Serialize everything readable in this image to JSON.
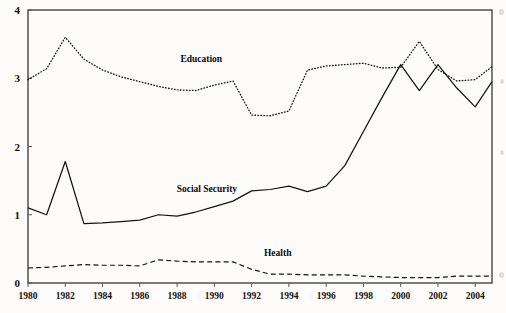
{
  "chart_data": {
    "type": "line",
    "title": "",
    "subtitle": "",
    "xlabel": "",
    "ylabel": "",
    "xlim": [
      1980,
      2004.9
    ],
    "ylim": [
      0,
      4
    ],
    "grid": false,
    "legend_position": "inline-annotations",
    "x_tick_labels": [
      "1980",
      "1982",
      "1984",
      "1986",
      "1988",
      "1990",
      "1992",
      "1994",
      "1996",
      "1998",
      "2000",
      "2002",
      "2004"
    ],
    "x_ticks": [
      1980,
      1982,
      1984,
      1986,
      1988,
      1990,
      1992,
      1994,
      1996,
      1998,
      2000,
      2002,
      2004
    ],
    "y_tick_labels": [
      "0",
      "1",
      "2",
      "3",
      "4"
    ],
    "y_ticks": [
      0,
      1,
      2,
      3,
      4
    ],
    "x": [
      1980,
      1981,
      1982,
      1983,
      1984,
      1985,
      1986,
      1987,
      1988,
      1989,
      1990,
      1991,
      1992,
      1993,
      1994,
      1995,
      1996,
      1997,
      1998,
      1999,
      2000,
      2001,
      2002,
      2003,
      2004,
      2004.9
    ],
    "series": [
      {
        "name": "Education",
        "style": "dotted",
        "color": "#17140f",
        "label_x": 1989.3,
        "label_y": 3.24,
        "values": [
          2.98,
          3.14,
          3.6,
          3.28,
          3.12,
          3.02,
          2.95,
          2.88,
          2.83,
          2.82,
          2.9,
          2.96,
          2.46,
          2.45,
          2.52,
          3.12,
          3.18,
          3.2,
          3.22,
          3.15,
          3.16,
          3.54,
          3.13,
          2.96,
          2.98,
          3.17
        ]
      },
      {
        "name": "Social Security",
        "style": "solid",
        "color": "#17140f",
        "label_x": 1989.6,
        "label_y": 1.33,
        "values": [
          1.1,
          1.0,
          1.78,
          0.87,
          0.88,
          0.9,
          0.92,
          1.0,
          0.98,
          1.04,
          1.12,
          1.2,
          1.35,
          1.37,
          1.42,
          1.34,
          1.42,
          1.72,
          2.22,
          2.72,
          3.2,
          2.82,
          3.2,
          2.86,
          2.58,
          2.95
        ]
      },
      {
        "name": "Health",
        "style": "dashed",
        "color": "#17140f",
        "label_x": 1993.4,
        "label_y": 0.4,
        "values": [
          0.22,
          0.23,
          0.25,
          0.27,
          0.26,
          0.26,
          0.25,
          0.34,
          0.32,
          0.31,
          0.31,
          0.31,
          0.2,
          0.13,
          0.13,
          0.12,
          0.12,
          0.12,
          0.1,
          0.09,
          0.08,
          0.08,
          0.08,
          0.1,
          0.1,
          0.1
        ]
      }
    ]
  },
  "annotations": {
    "education_label": "Education",
    "social_security_label": "Social Security",
    "health_label": "Health"
  }
}
